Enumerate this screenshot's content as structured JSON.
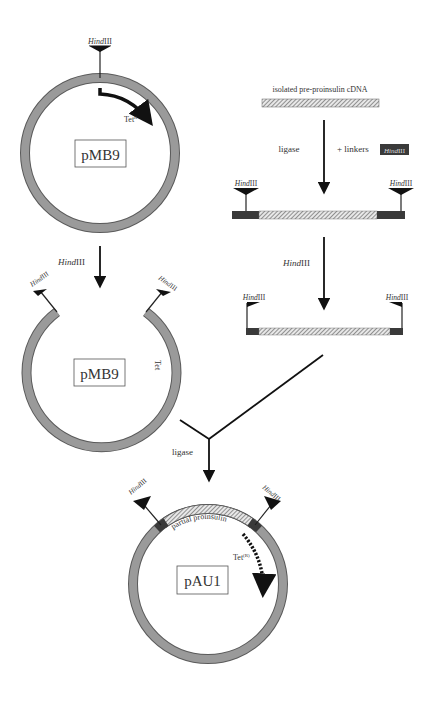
{
  "diagram": {
    "type": "cloning-workflow",
    "colors": {
      "plasmid_ring": "#9a9a9a",
      "ring_outline": "#5a5a5a",
      "linker": "#3a3a3a",
      "arrow": "#111111",
      "text": "#333333"
    },
    "plasmid_top": {
      "name": "pMB9",
      "site_label_italic": "Hind",
      "site_label_roman": "III",
      "gene_label": "Tet",
      "gene_superscript": "R"
    },
    "step1": {
      "enzyme_italic": "Hind",
      "enzyme_roman": "III"
    },
    "plasmid_open": {
      "name": "pMB9",
      "gene_label": "Tet",
      "left_site_italic": "Hind",
      "left_site_roman": "III",
      "right_site_italic": "Hind",
      "right_site_roman": "III"
    },
    "cdna": {
      "label": "isolated pre-proinsulin cDNA"
    },
    "ligation": {
      "left_label": "ligase",
      "right_label": "+ linkers",
      "linker_badge_italic": "Hind",
      "linker_badge_roman": "III",
      "left_site_italic": "Hind",
      "left_site_roman": "III",
      "right_site_italic": "Hind",
      "right_site_roman": "III"
    },
    "digest": {
      "enzyme_italic": "Hind",
      "enzyme_roman": "III",
      "left_site_italic": "Hind",
      "left_site_roman": "III",
      "right_site_italic": "Hind",
      "right_site_roman": "III"
    },
    "final_ligation": {
      "label": "ligase"
    },
    "plasmid_final": {
      "name": "pAU1",
      "insert_label": "partial proinsulin",
      "gene_label": "Tet",
      "gene_superscript": "(R)",
      "left_site_italic": "Hind",
      "left_site_roman": "III",
      "right_site_italic": "Hind",
      "right_site_roman": "III"
    }
  }
}
